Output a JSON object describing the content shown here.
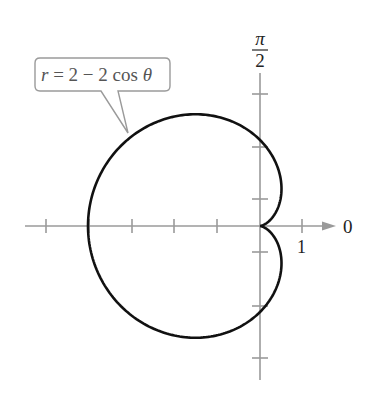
{
  "chart_data": {
    "type": "line",
    "subtype": "polar",
    "title": "",
    "equation": "r = 2 − 2 cos θ",
    "curve": "cardioid",
    "axis_labels": {
      "polar_axis": "0",
      "vertical_axis_numerator": "π",
      "vertical_axis_denominator": "2"
    },
    "tick_labels": [
      {
        "position": 1,
        "label": "1"
      }
    ],
    "x_ticks": [
      -5,
      -4,
      -3,
      -2,
      -1,
      1
    ],
    "xlim": [
      -5.4,
      1.7
    ],
    "grid": false,
    "legend": null,
    "points": [
      {
        "theta": "0",
        "r": 0
      },
      {
        "theta": "π/2",
        "r": 2
      },
      {
        "theta": "π",
        "r": 4
      },
      {
        "theta": "3π/2",
        "r": 2
      }
    ]
  },
  "callout": {
    "lhs": "r",
    "eq": " = 2 − 2 cos ",
    "theta": "θ"
  },
  "labels": {
    "zero": "0",
    "one": "1",
    "pi": "π",
    "two": "2"
  }
}
